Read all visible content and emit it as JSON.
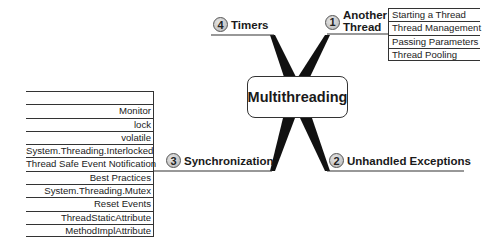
{
  "central_topic": "Multithreading",
  "branches": [
    {
      "number": "1",
      "label_lines": [
        "Another",
        "Thread"
      ],
      "position": "top-right",
      "subtopics": [
        "Starting a Thread",
        "Thread Management",
        "Passing Parameters",
        "Thread Pooling"
      ]
    },
    {
      "number": "2",
      "label": "Unhandled Exceptions",
      "position": "bottom-right",
      "subtopics": []
    },
    {
      "number": "3",
      "label": "Synchronization",
      "position": "bottom-left",
      "subtopics": [
        "Monitor",
        "lock",
        "volatile",
        "System.Threading.Interlocked",
        "Thread Safe Event Notification",
        "Best Practices",
        "System.Threading.Mutex",
        "Reset Events",
        "ThreadStaticAttribute",
        "MethodImplAttribute"
      ]
    },
    {
      "number": "4",
      "label": "Timers",
      "position": "top-left",
      "subtopics": []
    }
  ],
  "colors": {
    "lines": "#1a1a1a",
    "badge_fill": "#c8c8c8",
    "background": "#ffffff"
  }
}
